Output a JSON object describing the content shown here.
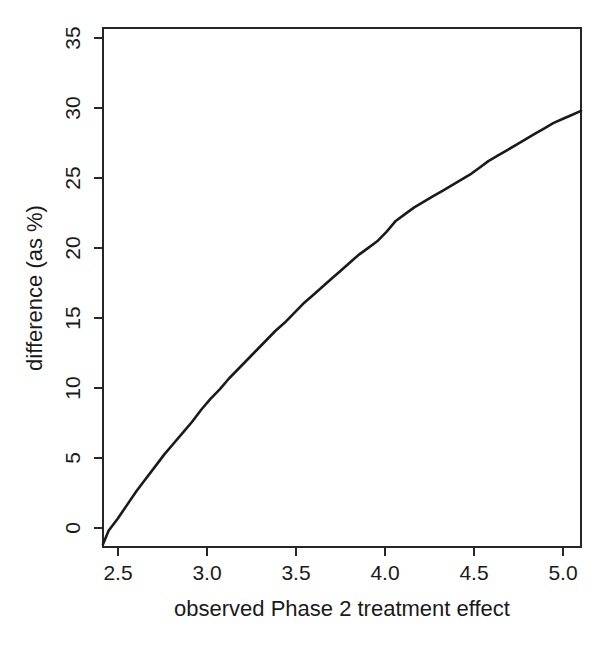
{
  "chart_data": {
    "type": "line",
    "title": "",
    "subtitle": "",
    "xlabel": "observed Phase 2 treatment effect",
    "ylabel": "difference (as %)",
    "xlim": [
      2.42,
      5.0
    ],
    "ylim": [
      -1.6,
      36.6
    ],
    "xticks": [
      2.5,
      3.0,
      3.5,
      4.0,
      4.5,
      5.0
    ],
    "xtick_labels": [
      "2.5",
      "3.0",
      "3.5",
      "4.0",
      "4.5",
      "5.0"
    ],
    "yticks": [
      0,
      5,
      10,
      15,
      20,
      25,
      30,
      35
    ],
    "ytick_labels": [
      "0",
      "5",
      "10",
      "15",
      "20",
      "25",
      "30",
      "35"
    ],
    "grid": false,
    "legend": null,
    "legend_position": "none",
    "box_frame": true,
    "series": [
      {
        "name": "difference",
        "color": "#1a1a1a",
        "x": [
          2.42,
          2.45,
          2.5,
          2.55,
          2.6,
          2.65,
          2.7,
          2.75,
          2.8,
          2.85,
          2.9,
          2.95,
          3.0,
          3.05,
          3.1,
          3.15,
          3.2,
          3.25,
          3.3,
          3.35,
          3.4,
          3.45,
          3.5,
          3.55,
          3.6,
          3.65,
          3.7,
          3.75,
          3.8,
          3.85,
          3.9,
          3.95,
          4.0,
          4.05,
          4.1,
          4.15,
          4.2,
          4.25,
          4.3,
          4.35,
          4.4,
          4.45,
          4.5,
          4.55,
          4.6,
          4.65,
          4.7,
          4.75,
          4.8,
          4.85,
          4.9,
          4.95,
          5.0
        ],
        "y": [
          -1.4,
          -0.4,
          0.5,
          1.5,
          2.5,
          3.4,
          4.3,
          5.2,
          6.0,
          6.8,
          7.6,
          8.5,
          9.3,
          10.0,
          10.8,
          11.5,
          12.2,
          12.9,
          13.6,
          14.3,
          14.9,
          15.6,
          16.3,
          16.9,
          17.5,
          18.1,
          18.7,
          19.3,
          19.9,
          20.4,
          20.9,
          21.6,
          22.4,
          22.9,
          23.4,
          23.8,
          24.2,
          24.6,
          25.0,
          25.4,
          25.8,
          26.3,
          26.8,
          27.2,
          27.6,
          28.0,
          28.4,
          28.8,
          29.2,
          29.6,
          29.9,
          30.2,
          30.5
        ]
      }
    ],
    "annotations": []
  },
  "figure": {
    "background_color": "#ffffff",
    "axis_color": "#262626",
    "curve_color": "#1a1a1a"
  }
}
